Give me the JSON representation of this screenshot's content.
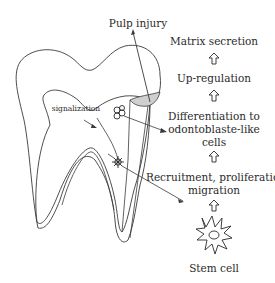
{
  "diagram": {
    "title_label": "Pulp injury",
    "signal_label": "signalization",
    "steps": [
      {
        "line1": "Matrix secretion",
        "line2": ""
      },
      {
        "line1": "Up-regulation",
        "line2": ""
      },
      {
        "line1": "Differentiation to",
        "line2": "odontoblaste-like",
        "line3": "cells"
      },
      {
        "line1": "Recruitment, proliferation",
        "line2": "migration"
      },
      {
        "line1": "Stem cell",
        "line2": ""
      }
    ],
    "icons": {
      "flow_arrow": "hollow-up-arrow",
      "stem_cell": "star-cell-icon",
      "differentiated_cell": "cluster-cell-icon",
      "recruited_cell": "spiky-cell-icon"
    },
    "colors": {
      "line": "#3a3a3a",
      "injury_fill": "#cfcfcf",
      "text": "#2a2a2a",
      "background": "#ffffff"
    }
  }
}
